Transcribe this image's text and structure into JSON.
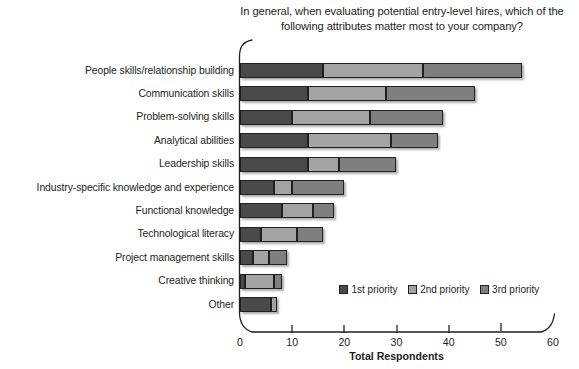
{
  "chart_data": {
    "type": "bar",
    "subtype": "stacked-horizontal",
    "title": "In general, when evaluating potential entry-level hires, which of the following attributes matter most to your company?",
    "title_line1": "In general, when evaluating potential entry-level hires, which of the",
    "title_line2": "following attributes matter most to your company?",
    "xlabel": "Total Respondents",
    "ylabel": "",
    "xlim": [
      0,
      60
    ],
    "xticks": [
      0,
      10,
      20,
      30,
      40,
      50,
      60
    ],
    "xtick_labels": [
      "0",
      "10",
      "20",
      "30",
      "40",
      "50",
      "60"
    ],
    "grid": false,
    "legend_position": "inside-lower-right",
    "categories": [
      "People skills/relationship building",
      "Communication skills",
      "Problem-solving skills",
      "Analytical abilities",
      "Leadership skills",
      "Industry-specific knowledge and experience",
      "Functional knowledge",
      "Technological literacy",
      "Project management skills",
      "Creative thinking",
      "Other"
    ],
    "series": [
      {
        "name": "1st priority",
        "color": "#4a4a4a",
        "values": [
          16,
          13,
          10,
          13,
          13,
          6.5,
          8,
          4,
          2.5,
          1,
          6
        ]
      },
      {
        "name": "2nd priority",
        "color": "#a3a3a3",
        "values": [
          19,
          15,
          15,
          16,
          6,
          3.5,
          6,
          7,
          3,
          5.5,
          1
        ]
      },
      {
        "name": "3rd priority",
        "color": "#7f7f7f",
        "values": [
          19,
          17,
          14,
          9,
          11,
          10,
          4,
          5,
          3.5,
          1.5,
          0
        ]
      }
    ],
    "totals": [
      54,
      45,
      39,
      38,
      30,
      20,
      18,
      16,
      9,
      8,
      7
    ]
  },
  "legend": {
    "items": [
      {
        "label": "1st priority",
        "swatch": "p1"
      },
      {
        "label": "2nd priority",
        "swatch": "p2"
      },
      {
        "label": "3rd priority",
        "swatch": "p3"
      }
    ]
  }
}
